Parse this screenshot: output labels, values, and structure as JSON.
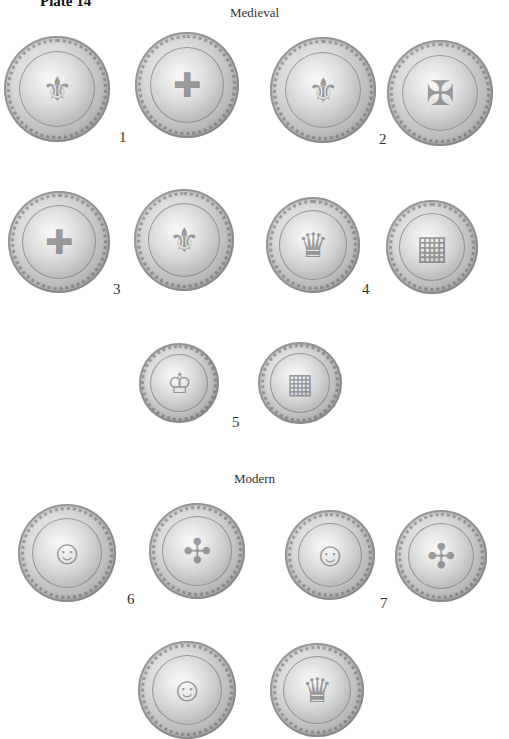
{
  "plate": {
    "title": "Plate 14"
  },
  "sections": [
    {
      "title": "Medieval"
    },
    {
      "title": "Modern"
    }
  ],
  "coins": [
    {
      "number": "1",
      "obverse_device": "crowned shield with fleurs-de-lis",
      "reverse_device": "cross fleury in quatrefoil",
      "obverse_glyph": "⚜",
      "reverse_glyph": "✚"
    },
    {
      "number": "2",
      "obverse_device": "crowned shield with three fleurs-de-lis",
      "reverse_device": "cross with fleur-de-lis ends",
      "obverse_glyph": "⚜",
      "reverse_glyph": "✠"
    },
    {
      "number": "3",
      "obverse_device": "quartered shield",
      "reverse_device": "cross fleury",
      "obverse_glyph": "✚",
      "reverse_glyph": "⚜"
    },
    {
      "number": "4",
      "obverse_device": "crowned eagle shield",
      "reverse_device": "quartered arms",
      "obverse_glyph": "♛",
      "reverse_glyph": "▦"
    },
    {
      "number": "5",
      "obverse_device": "seated figure",
      "reverse_device": "shield on eagle",
      "obverse_glyph": "♔",
      "reverse_glyph": "▦"
    },
    {
      "number": "6",
      "obverse_device": "laureate portrait",
      "reverse_device": "four crowned L's cruciform",
      "obverse_glyph": "☺",
      "reverse_glyph": "✣"
    },
    {
      "number": "7",
      "obverse_device": "portrait with wig",
      "reverse_device": "four crowned L's cruciform",
      "obverse_glyph": "☺",
      "reverse_glyph": "✣"
    },
    {
      "number": "",
      "obverse_device": "portrait (partially visible)",
      "reverse_device": "crowned device (partially visible)",
      "obverse_glyph": "☺",
      "reverse_glyph": "♛"
    }
  ]
}
